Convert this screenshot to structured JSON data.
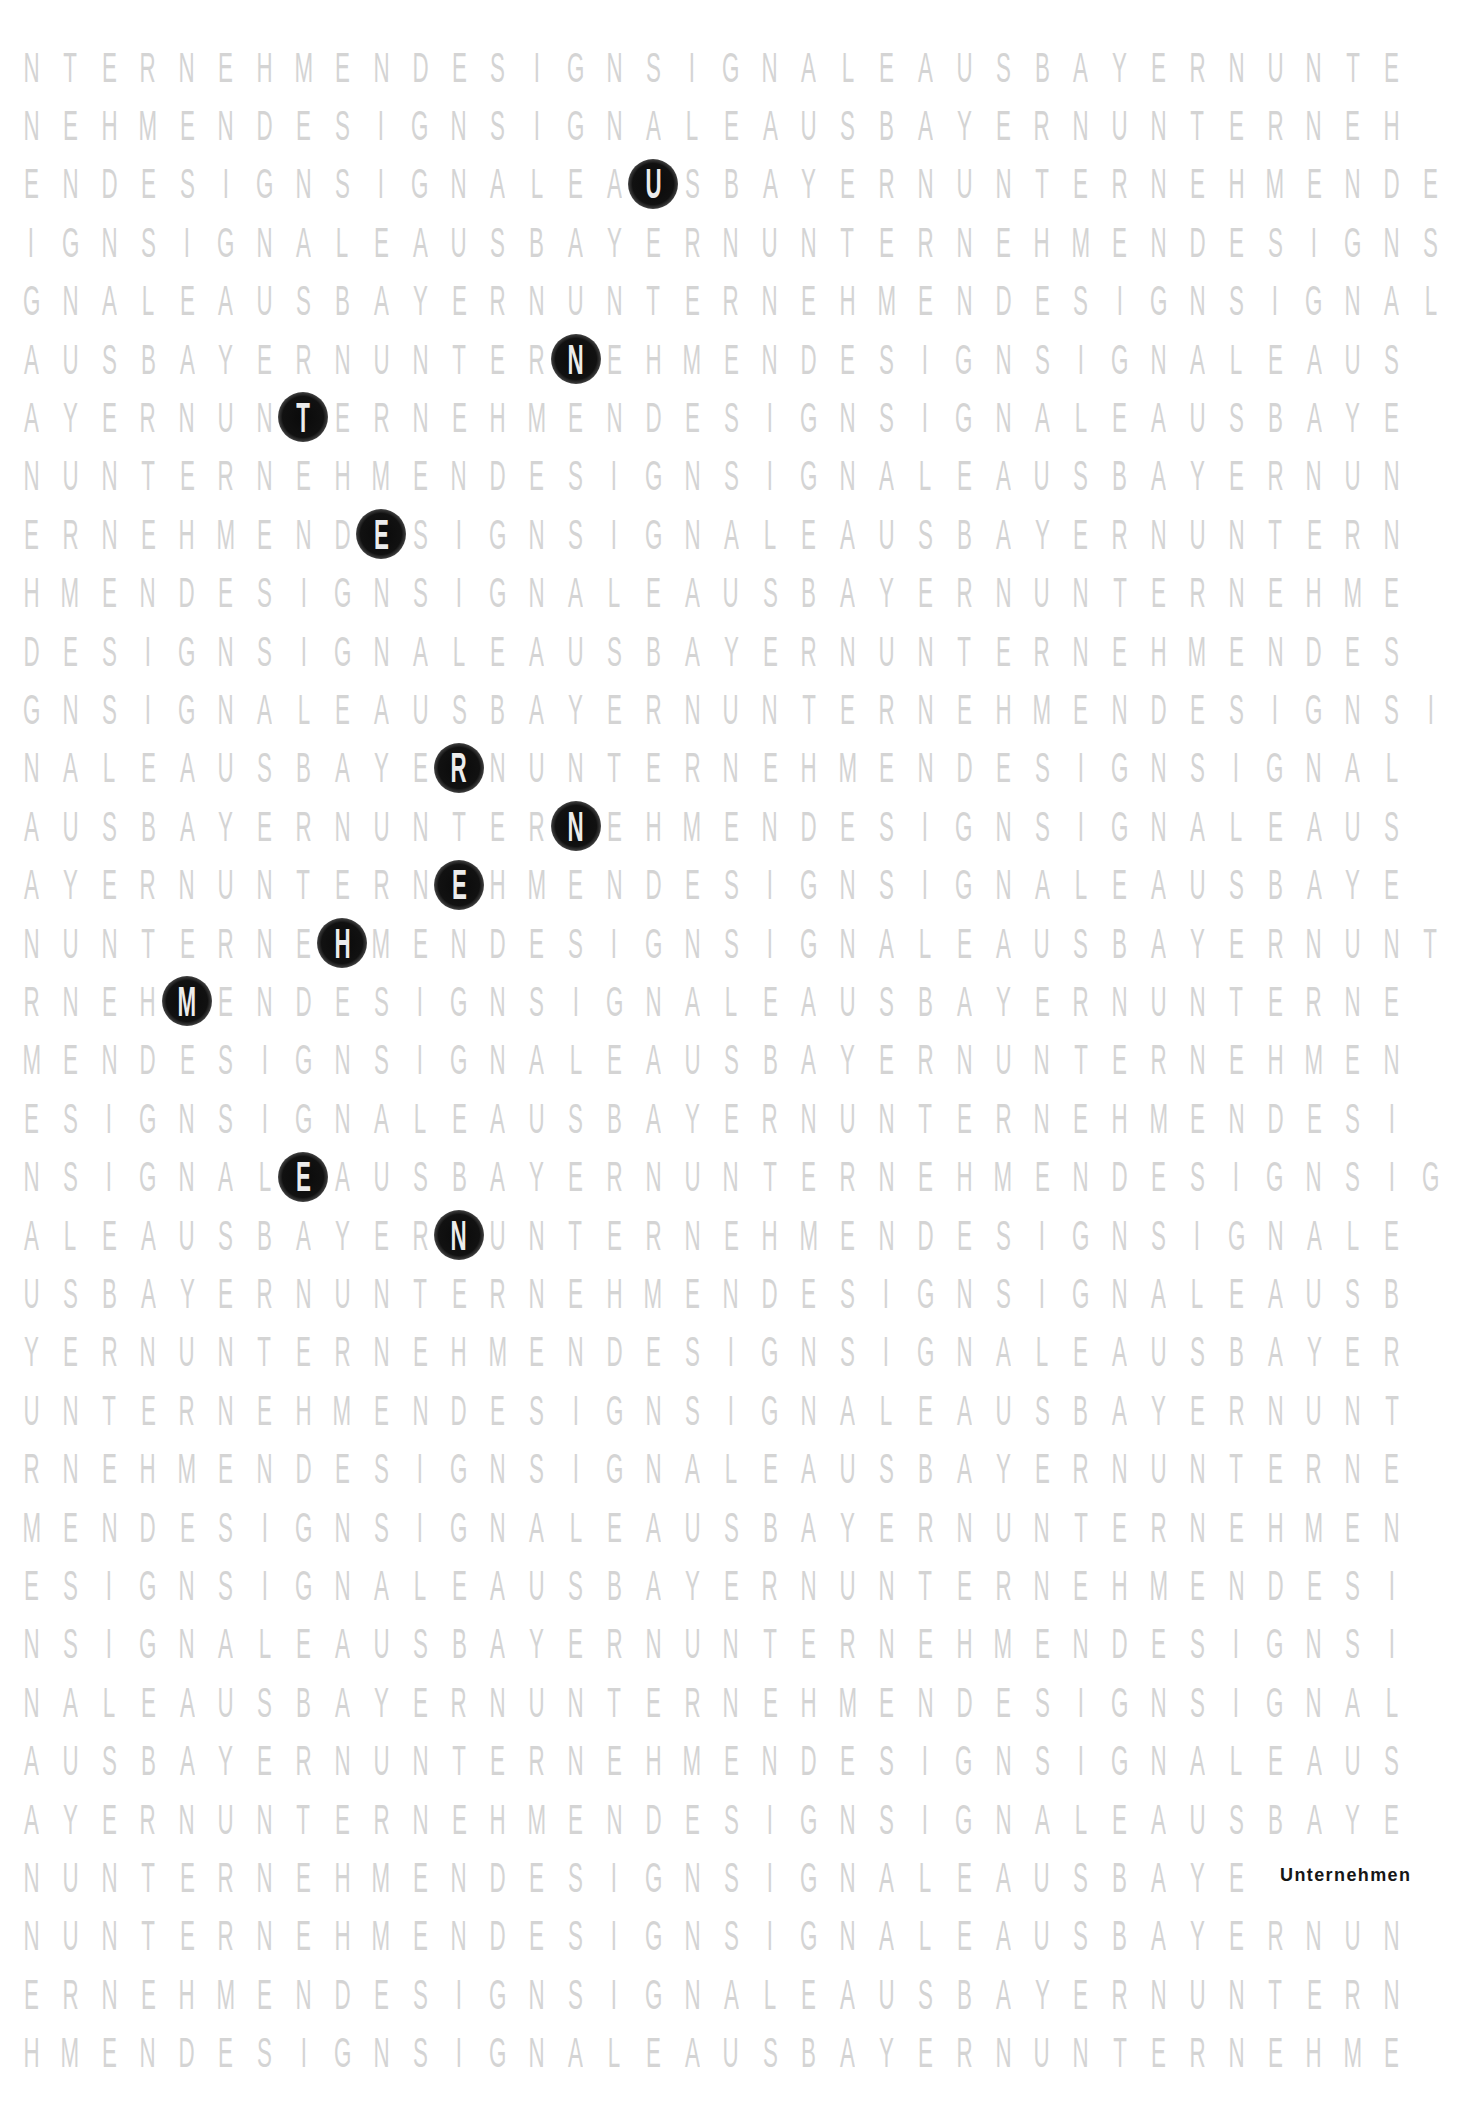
{
  "poster": {
    "grid": {
      "rows": [
        {
          "text": "NTERNEHMENDESIGNSIGNALEAUSBAYERNUNTE",
          "highlight": null
        },
        {
          "text": "NEHMENDESIGNSIGNALEAUSBAYERNUNTERNEH",
          "highlight": null
        },
        {
          "text": "ENDESIGNSIGNALEAUSBAYERNUNTERNEHMENDE",
          "highlight": 16
        },
        {
          "text": "IGNSIGNALEAUSBAYERNUNTERNEHMENDESIGNS",
          "highlight": null
        },
        {
          "text": "GNALEAUSBAYERNUNTERNEHMENDESIGNSIGNAL",
          "highlight": null
        },
        {
          "text": "AUSBAYERNUNTERNEHMENDESIGNSIGNALEAUS",
          "highlight": 14
        },
        {
          "text": "AYERNUNTERNEHMENDESIGNSIGNALEAUSBAYE",
          "highlight": 7
        },
        {
          "text": "NUNTERNEHMENDESIGNSIGNALEAUSBAYERNUN",
          "highlight": null
        },
        {
          "text": "ERNEHMENDESIGNSIGNALEAUSBAYERNUNTERN",
          "highlight": 9
        },
        {
          "text": "HMENDESIGNSIGNALEAUSBAYERNUNTERNEHME",
          "highlight": null
        },
        {
          "text": "DESIGNSIGNALEAUSBAYERNUNTERNEHMENDES",
          "highlight": null
        },
        {
          "text": "GNSIGNALEAUSBAYERNUNTERNEHMENDESIGNSI",
          "highlight": null
        },
        {
          "text": "NALEAUSBAYERNUNTERNEHMENDESIGNSIGNAL",
          "highlight": 11
        },
        {
          "text": "AUSBAYERNUNTERNEHMENDESIGNSIGNALEAUS",
          "highlight": 14
        },
        {
          "text": "AYERNUNTERNEHMENDESIGNSIGNALEAUSBAYE",
          "highlight": 11
        },
        {
          "text": "NUNTERNEHMENDESIGNSIGNALEAUSBAYERNUNT",
          "highlight": 8
        },
        {
          "text": "RNEHMENDESIGNSIGNALEAUSBAYERNUNTERNE",
          "highlight": 4
        },
        {
          "text": "MENDESIGNSIGNALEAUSBAYERNUNTERNEHMEN",
          "highlight": null
        },
        {
          "text": "ESIGNSIGNALEAUSBAYERNUNTERNEHMENDESI",
          "highlight": null
        },
        {
          "text": "NSIGNALEAUSBAYERNUNTERNEHMENDESIGNSIG",
          "highlight": 7
        },
        {
          "text": "ALEAUSBAYERNUNTERNEHMENDESIGNSIGNALE",
          "highlight": 11
        },
        {
          "text": "USBAYERNUNTERNEHMENDESIGNSIGNALEAUSB",
          "highlight": null
        },
        {
          "text": "YERNUNTERNEHMENDESIGNSIGNALEAUSBAYER",
          "highlight": null
        },
        {
          "text": "UNTERNEHMENDESIGNSIGNALEAUSBAYERNUNT",
          "highlight": null
        },
        {
          "text": "RNEHMENDESIGNSIGNALEAUSBAYERNUNTERNE",
          "highlight": null
        },
        {
          "text": "MENDESIGNSIGNALEAUSBAYERNUNTERNEHMEN",
          "highlight": null
        },
        {
          "text": "ESIGNSIGNALEAUSBAYERNUNTERNEHMENDESI",
          "highlight": null
        },
        {
          "text": "NSIGNALEAUSBAYERNUNTERNEHMENDESIGNSI",
          "highlight": null
        },
        {
          "text": "NALEAUSBAYERNUNTERNEHMENDESIGNSIGNAL",
          "highlight": null
        },
        {
          "text": "AUSBAYERNUNTERNEHMENDESIGNSIGNALEAUS",
          "highlight": null
        },
        {
          "text": "AYERNUNTERNEHMENDESIGNSIGNALEAUSBAYE",
          "highlight": null
        },
        {
          "text": "NUNTERNEHMENDESIGNSIGNALEAUSBAYE",
          "highlight": null
        },
        {
          "text": "NUNTERNEHMENDESIGNSIGNALEAUSBAYERNUN",
          "highlight": null
        },
        {
          "text": "ERNEHMENDESIGNSIGNALEAUSBAYERNUNTERN",
          "highlight": null
        },
        {
          "text": "HMENDESIGNSIGNALEAUSBAYERNUNTERNEHME",
          "highlight": null
        }
      ],
      "hidden_word": "UNTERNEHMEN",
      "colors": {
        "letter": "#d4d4d4",
        "highlight_dot": "#0a0a0a",
        "highlight_letter": "#ececec"
      }
    },
    "label": "Unternehmen"
  }
}
